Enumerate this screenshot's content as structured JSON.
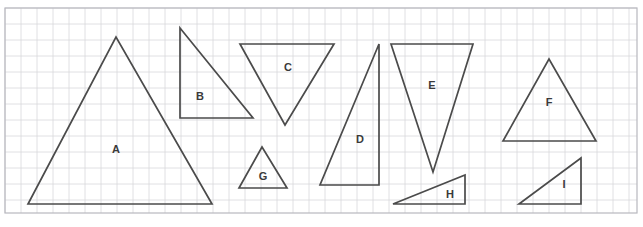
{
  "worksheet": {
    "title": "Triangles on grid worksheet",
    "width": 643,
    "height": 227,
    "background_color": "#ffffff"
  },
  "grid": {
    "name": "square-grid",
    "x": 5,
    "y": 8,
    "width": 632,
    "height": 205,
    "cell_size": 16,
    "minor_line_color": "#d8d8dc",
    "major_line_color": "#b8b8be",
    "border_color": "#b8b8be"
  },
  "style": {
    "shape_stroke_color": "#4b4b4b",
    "shape_stroke_width": 1.7,
    "label_color": "#3a3a3a",
    "label_font_size": 11
  },
  "shapes": [
    {
      "id": "triangle-a",
      "label": "A",
      "kind": "isosceles",
      "points": "28,204 116,37 212,204",
      "label_x": 116,
      "label_y": 150
    },
    {
      "id": "triangle-b",
      "label": "B",
      "kind": "right",
      "points": "180,28 253,118 180,118",
      "label_x": 200,
      "label_y": 97
    },
    {
      "id": "triangle-c",
      "label": "C",
      "kind": "inverted-isosceles",
      "points": "240,44 334,44 285,125",
      "label_x": 288,
      "label_y": 68
    },
    {
      "id": "triangle-d",
      "label": "D",
      "kind": "right",
      "points": "379,44 379,185 320,185",
      "label_x": 360,
      "label_y": 140
    },
    {
      "id": "triangle-e",
      "label": "E",
      "kind": "inverted-isosceles",
      "points": "391,44 473,44 433,172",
      "label_x": 432,
      "label_y": 86
    },
    {
      "id": "triangle-f",
      "label": "F",
      "kind": "isosceles",
      "points": "503,141 549,59 596,141",
      "label_x": 549,
      "label_y": 103
    },
    {
      "id": "triangle-g",
      "label": "G",
      "kind": "isosceles",
      "points": "239,188 262,147 287,188",
      "label_x": 263,
      "label_y": 177
    },
    {
      "id": "triangle-h",
      "label": "H",
      "kind": "right-scalene",
      "points": "393,204 465,175 465,204",
      "label_x": 450,
      "label_y": 195
    },
    {
      "id": "triangle-i",
      "label": "I",
      "kind": "right",
      "points": "519,204 581,158 581,204",
      "label_x": 564,
      "label_y": 185
    }
  ]
}
